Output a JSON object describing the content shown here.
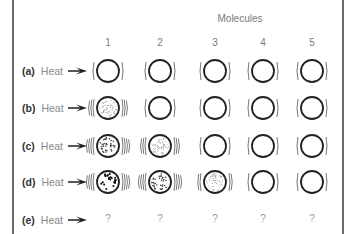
{
  "title": "Molecules",
  "columns": [
    "1",
    "2",
    "3",
    "4",
    "5"
  ],
  "rows": [
    {
      "letter": "(a)",
      "label": "Heat",
      "cells": [
        {
          "fill": "none",
          "lines": 1
        },
        {
          "fill": "none",
          "lines": 1
        },
        {
          "fill": "none",
          "lines": 1
        },
        {
          "fill": "none",
          "lines": 1
        },
        {
          "fill": "none",
          "lines": 1
        }
      ]
    },
    {
      "letter": "(b)",
      "label": "Heat",
      "cells": [
        {
          "fill": "fine",
          "lines": 3
        },
        {
          "fill": "none",
          "lines": 1
        },
        {
          "fill": "none",
          "lines": 1
        },
        {
          "fill": "none",
          "lines": 1
        },
        {
          "fill": "none",
          "lines": 1
        }
      ]
    },
    {
      "letter": "(c)",
      "label": "Heat",
      "cells": [
        {
          "fill": "medium",
          "lines": 4
        },
        {
          "fill": "fine",
          "lines": 3
        },
        {
          "fill": "none",
          "lines": 1
        },
        {
          "fill": "none",
          "lines": 1
        },
        {
          "fill": "none",
          "lines": 1
        }
      ]
    },
    {
      "letter": "(d)",
      "label": "Heat",
      "cells": [
        {
          "fill": "coarse",
          "lines": 5
        },
        {
          "fill": "medium",
          "lines": 4
        },
        {
          "fill": "fine",
          "lines": 2
        },
        {
          "fill": "none",
          "lines": 1
        },
        {
          "fill": "none",
          "lines": 1
        }
      ]
    },
    {
      "letter": "(e)",
      "label": "Heat",
      "cells": [
        "?",
        "?",
        "?",
        "?",
        "?"
      ]
    }
  ],
  "colors": {
    "frame": "#6b6b6b",
    "circle": "#222222",
    "label": "#8a8a8a",
    "letter": "#333333"
  }
}
